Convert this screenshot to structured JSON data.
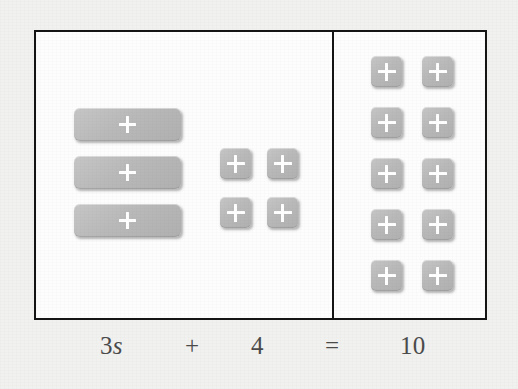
{
  "diagram": {
    "background_color": "#f1f1f0",
    "box_border_color": "#141414",
    "tile_color": "#b9b9b9",
    "tile_symbol": "plus",
    "panels": {
      "left": {
        "name": "left-side-of-equation",
        "bar_tiles": {
          "name": "variable-bar-tiles",
          "count": 3,
          "represents": "3s",
          "symbol": "plus"
        },
        "unit_tiles": {
          "name": "unit-square-tiles",
          "count": 4,
          "represents": "4",
          "rows": 2,
          "columns": 2,
          "symbol": "plus"
        }
      },
      "right": {
        "name": "right-side-of-equation",
        "unit_tiles": {
          "name": "unit-square-tiles",
          "count": 10,
          "represents": "10",
          "rows": 5,
          "columns": 2,
          "symbol": "plus"
        }
      }
    }
  },
  "equation": {
    "lhs_coefficient": "3",
    "lhs_variable": "s",
    "plus_operator": "+",
    "lhs_constant": "4",
    "equals_operator": "=",
    "rhs_value": "10",
    "full_text": "3s + 4 = 10"
  }
}
